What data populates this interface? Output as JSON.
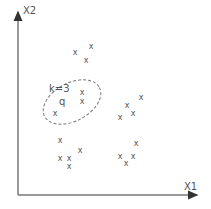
{
  "diagram": {
    "axes": {
      "x_label": "X1",
      "y_label": "X2",
      "origin": [
        18,
        195
      ],
      "x_end": [
        197,
        195
      ],
      "y_end": [
        18,
        12
      ],
      "color": "#666666"
    },
    "query": {
      "label": "q",
      "pos": [
        62,
        103
      ]
    },
    "k_label": "k=3",
    "neighborhood_ellipse": {
      "cx": 72,
      "cy": 102,
      "rx": 31,
      "ry": 19,
      "rotate": -28,
      "style": "dashed"
    },
    "points_marker": "x",
    "points": [
      [
        75,
        53
      ],
      [
        91,
        47
      ],
      [
        86,
        61
      ],
      [
        82,
        93
      ],
      [
        82,
        102
      ],
      [
        55,
        114
      ],
      [
        141,
        98
      ],
      [
        127,
        106
      ],
      [
        133,
        114
      ],
      [
        120,
        118
      ],
      [
        60,
        141
      ],
      [
        80,
        151
      ],
      [
        60,
        159
      ],
      [
        69,
        159
      ],
      [
        69,
        167
      ],
      [
        136,
        144
      ],
      [
        120,
        157
      ],
      [
        133,
        157
      ],
      [
        126,
        164
      ]
    ]
  }
}
